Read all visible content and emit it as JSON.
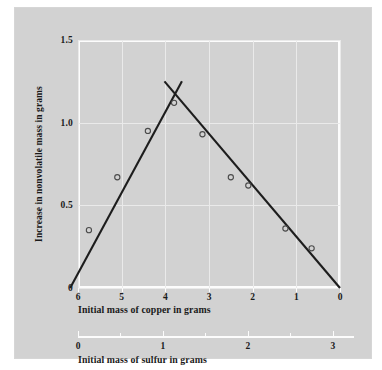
{
  "chart_data": {
    "type": "scatter",
    "title": "",
    "xlabel": "Initial mass of copper in grams",
    "ylabel": "Increase in nonvolatile mass in grams",
    "secondary_xlabel": "Initial mass of sulfur in grams",
    "grid": true,
    "legend": "none",
    "xlim": [
      6,
      0
    ],
    "ylim": [
      0,
      1.5
    ],
    "x_reversed": true,
    "xticks": [
      6,
      5,
      4,
      3,
      2,
      1,
      0
    ],
    "xtick_labels": [
      "6",
      "5",
      "4",
      "3",
      "2",
      "1",
      "0"
    ],
    "yticks": [
      0,
      0.5,
      1.0,
      1.5
    ],
    "ytick_labels": [
      "0",
      "0.5",
      "1.0",
      "1.5"
    ],
    "secondary_xlim": [
      0,
      3.25
    ],
    "secondary_xticks": [
      0,
      1,
      2,
      3
    ],
    "secondary_xtick_labels": [
      "0",
      "1",
      "2",
      "3"
    ],
    "secondary_xticks_minor": [
      0.5,
      1.5,
      2.5
    ],
    "points": [
      {
        "x": 5.75,
        "y": 0.35
      },
      {
        "x": 5.1,
        "y": 0.67
      },
      {
        "x": 4.4,
        "y": 0.95
      },
      {
        "x": 3.8,
        "y": 1.12
      },
      {
        "x": 3.15,
        "y": 0.93
      },
      {
        "x": 2.5,
        "y": 0.67
      },
      {
        "x": 2.1,
        "y": 0.62
      },
      {
        "x": 1.25,
        "y": 0.36
      },
      {
        "x": 0.65,
        "y": 0.24
      }
    ],
    "series": [
      {
        "name": "rising-limb",
        "type": "line",
        "x": [
          6.18,
          3.62
        ],
        "y": [
          0.0,
          1.25
        ]
      },
      {
        "name": "falling-limb",
        "type": "line",
        "x": [
          4.02,
          0.0
        ],
        "y": [
          1.25,
          0.0
        ]
      }
    ],
    "intersection": {
      "x": 3.83,
      "y": 1.18
    },
    "colors": {
      "background": "#d2d2d2",
      "page": "#ffffff",
      "line": "#1d1d1d",
      "marker": "#4a4a4a",
      "grid": "#eaeaea",
      "axis": "#fcfcfc",
      "text": "#1a1a1a"
    }
  }
}
